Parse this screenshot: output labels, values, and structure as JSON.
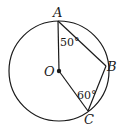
{
  "diagram": {
    "type": "circle-geometry",
    "circle": {
      "center_label": "O",
      "cx": 59,
      "cy": 71,
      "r": 50
    },
    "points": {
      "A": {
        "label": "A",
        "x": 58,
        "y": 21
      },
      "B": {
        "label": "B",
        "x": 106,
        "y": 66
      },
      "C": {
        "label": "C",
        "x": 88,
        "y": 111
      },
      "O": {
        "label": "O",
        "x": 59,
        "y": 71
      }
    },
    "segments": [
      "OA",
      "AB",
      "BC",
      "OC"
    ],
    "angles": {
      "OAB": {
        "label": "50°"
      },
      "OCB": {
        "label": "60°"
      }
    }
  }
}
